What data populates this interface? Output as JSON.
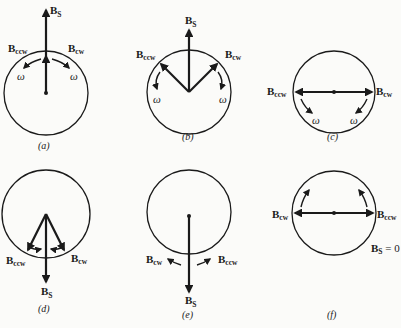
{
  "figure": {
    "panels": [
      {
        "id": "a",
        "caption": "(a)",
        "labels": {
          "bs": "B",
          "bs_sub": "S",
          "ccw": "B",
          "ccw_sub": "ccw",
          "cw": "B",
          "cw_sub": "cw",
          "omega_left": "ω",
          "omega_right": "ω"
        }
      },
      {
        "id": "b",
        "caption": "(b)",
        "labels": {
          "bs": "B",
          "bs_sub": "S",
          "ccw": "B",
          "ccw_sub": "ccw",
          "cw": "B",
          "cw_sub": "cw",
          "omega_left": "ω",
          "omega_right": "ω"
        }
      },
      {
        "id": "c",
        "caption": "(c)",
        "labels": {
          "ccw": "B",
          "ccw_sub": "ccw",
          "cw": "B",
          "cw_sub": "cw",
          "omega_left": "ω",
          "omega_right": "ω"
        }
      },
      {
        "id": "d",
        "caption": "(d)",
        "labels": {
          "bs": "B",
          "bs_sub": "S",
          "ccw": "B",
          "ccw_sub": "ccw",
          "cw": "B",
          "cw_sub": "cw"
        }
      },
      {
        "id": "e",
        "caption": "(e)",
        "labels": {
          "bs": "B",
          "bs_sub": "S",
          "cw": "B",
          "cw_sub": "cw",
          "ccw": "B",
          "ccw_sub": "ccw"
        }
      },
      {
        "id": "f",
        "caption": "(f)",
        "labels": {
          "cw": "B",
          "cw_sub": "cw",
          "ccw": "B",
          "ccw_sub": "ccw",
          "bs": "B",
          "bs_sub": "S",
          "bs_eq": " = 0"
        }
      }
    ]
  }
}
